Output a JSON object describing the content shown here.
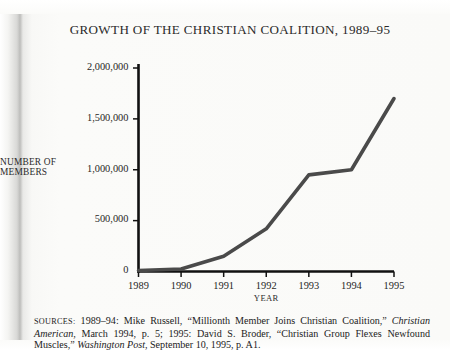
{
  "figure": {
    "title": "GROWTH OF THE CHRISTIAN COALITION, 1989–95",
    "sources_prefix": "SOURCES:",
    "sources_part1": " 1989–94: Mike Russell, “Millionth Member Joins Christian Coalition,” ",
    "sources_italic1": "Christian American",
    "sources_part2": ", March 1994, p. 5; 1995: David S. Broder, “Christian Group Flexes Newfound Muscles,” ",
    "sources_italic2": "Washington Post",
    "sources_part3": ", September 10, 1995, p. A1."
  },
  "chart_data": {
    "type": "line",
    "title": "GROWTH OF THE CHRISTIAN COALITION, 1989–95",
    "xlabel": "YEAR",
    "ylabel": "NUMBER OF MEMBERS",
    "ylabel_line1": "NUMBER OF",
    "ylabel_line2": "MEMBERS",
    "categories": [
      "1989",
      "1990",
      "1991",
      "1992",
      "1993",
      "1994",
      "1995"
    ],
    "x": [
      1989,
      1990,
      1991,
      1992,
      1993,
      1994,
      1995
    ],
    "values": [
      10000,
      25000,
      150000,
      420000,
      950000,
      1000000,
      1700000
    ],
    "ylim": [
      0,
      2000000
    ],
    "xlim": [
      1989,
      1995
    ],
    "yticks": [
      0,
      500000,
      1000000,
      1500000,
      2000000
    ],
    "ytick_labels": [
      "0",
      "500,000",
      "1,000,000",
      "1,500,000",
      "2,000,000"
    ],
    "grid": false,
    "legend": "none",
    "series": [
      {
        "name": "Number of members",
        "values": [
          10000,
          25000,
          150000,
          420000,
          950000,
          1000000,
          1700000
        ]
      }
    ],
    "line_color": "#4a4a4a",
    "axis_color": "#111111"
  }
}
